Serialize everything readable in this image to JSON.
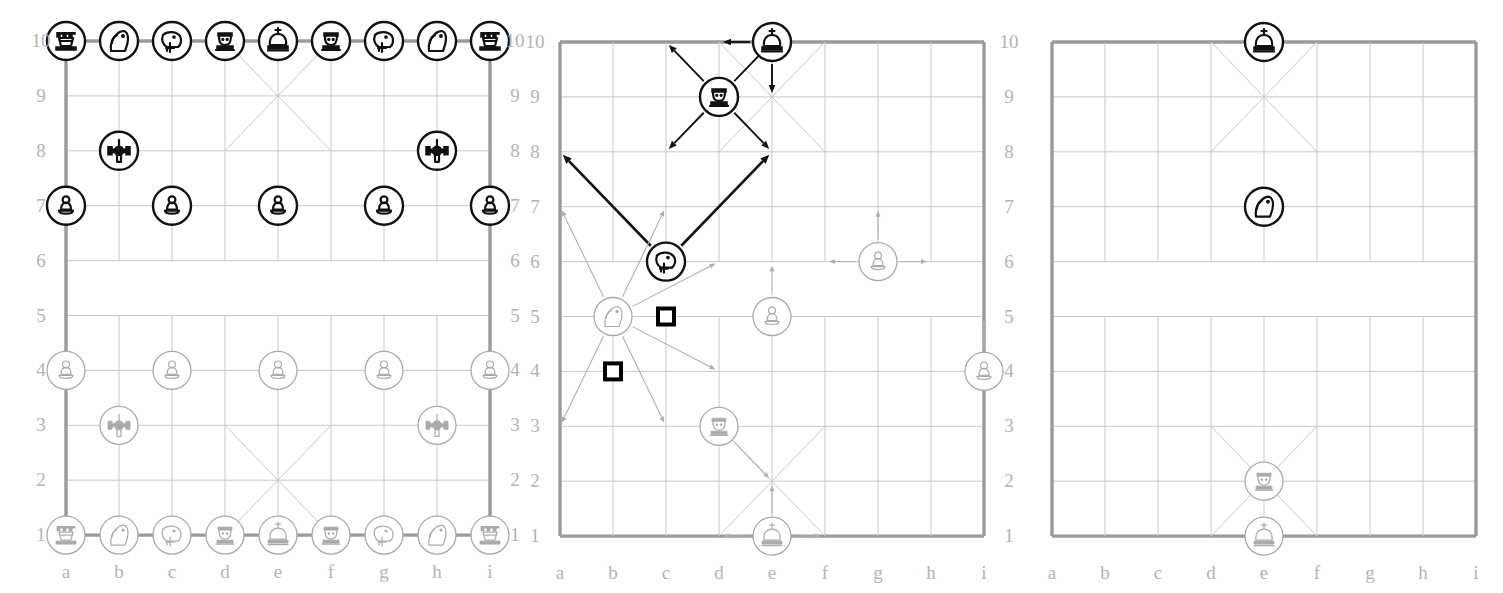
{
  "figure": {
    "type": "xiangqi-diagram",
    "panel_count": 3,
    "board": {
      "files": [
        "a",
        "b",
        "c",
        "d",
        "e",
        "f",
        "g",
        "h",
        "i"
      ],
      "ranks": [
        "10",
        "9",
        "8",
        "7",
        "6",
        "5",
        "4",
        "3",
        "2",
        "1"
      ],
      "rank_labels_left": [
        "10",
        "9",
        "8",
        "7",
        "6",
        "5",
        "4",
        "3",
        "2",
        "1"
      ],
      "rank_labels_right": [
        "10",
        "9",
        "8",
        "7",
        "6",
        "5",
        "4",
        "3",
        "2",
        "1"
      ]
    },
    "colors": {
      "black_piece": "#111111",
      "white_piece": "#aaaaaa",
      "grid_line": "#c9c9c9",
      "border_line": "#9a9a9a",
      "label": "#b4b4b4",
      "marker": "#000000"
    }
  },
  "panels": [
    {
      "id": "panel-initial-position",
      "name": "initial-position-board",
      "shows_rank_labels_both_sides": true,
      "shows_file_labels": true,
      "pieces": [
        {
          "file": "a",
          "rank": 10,
          "type": "rook",
          "side": "black",
          "glyph": "rook-icon"
        },
        {
          "file": "b",
          "rank": 10,
          "type": "knight",
          "side": "black",
          "glyph": "knight-icon"
        },
        {
          "file": "c",
          "rank": 10,
          "type": "elephant",
          "side": "black",
          "glyph": "elephant-icon"
        },
        {
          "file": "d",
          "rank": 10,
          "type": "advisor",
          "side": "black",
          "glyph": "advisor-icon"
        },
        {
          "file": "e",
          "rank": 10,
          "type": "king",
          "side": "black",
          "glyph": "king-icon"
        },
        {
          "file": "f",
          "rank": 10,
          "type": "advisor",
          "side": "black",
          "glyph": "advisor-icon"
        },
        {
          "file": "g",
          "rank": 10,
          "type": "elephant",
          "side": "black",
          "glyph": "elephant-icon"
        },
        {
          "file": "h",
          "rank": 10,
          "type": "knight",
          "side": "black",
          "glyph": "knight-icon"
        },
        {
          "file": "i",
          "rank": 10,
          "type": "rook",
          "side": "black",
          "glyph": "rook-icon"
        },
        {
          "file": "b",
          "rank": 8,
          "type": "cannon",
          "side": "black",
          "glyph": "cannon-icon"
        },
        {
          "file": "h",
          "rank": 8,
          "type": "cannon",
          "side": "black",
          "glyph": "cannon-icon"
        },
        {
          "file": "a",
          "rank": 7,
          "type": "pawn",
          "side": "black",
          "glyph": "pawn-icon"
        },
        {
          "file": "c",
          "rank": 7,
          "type": "pawn",
          "side": "black",
          "glyph": "pawn-icon"
        },
        {
          "file": "e",
          "rank": 7,
          "type": "pawn",
          "side": "black",
          "glyph": "pawn-icon"
        },
        {
          "file": "g",
          "rank": 7,
          "type": "pawn",
          "side": "black",
          "glyph": "pawn-icon"
        },
        {
          "file": "i",
          "rank": 7,
          "type": "pawn",
          "side": "black",
          "glyph": "pawn-icon"
        },
        {
          "file": "a",
          "rank": 4,
          "type": "pawn",
          "side": "white",
          "glyph": "pawn-icon"
        },
        {
          "file": "c",
          "rank": 4,
          "type": "pawn",
          "side": "white",
          "glyph": "pawn-icon"
        },
        {
          "file": "e",
          "rank": 4,
          "type": "pawn",
          "side": "white",
          "glyph": "pawn-icon"
        },
        {
          "file": "g",
          "rank": 4,
          "type": "pawn",
          "side": "white",
          "glyph": "pawn-icon"
        },
        {
          "file": "i",
          "rank": 4,
          "type": "pawn",
          "side": "white",
          "glyph": "pawn-icon"
        },
        {
          "file": "b",
          "rank": 3,
          "type": "cannon",
          "side": "white",
          "glyph": "cannon-icon"
        },
        {
          "file": "h",
          "rank": 3,
          "type": "cannon",
          "side": "white",
          "glyph": "cannon-icon"
        },
        {
          "file": "a",
          "rank": 1,
          "type": "rook",
          "side": "white",
          "glyph": "rook-icon"
        },
        {
          "file": "b",
          "rank": 1,
          "type": "knight",
          "side": "white",
          "glyph": "knight-icon"
        },
        {
          "file": "c",
          "rank": 1,
          "type": "elephant",
          "side": "white",
          "glyph": "elephant-icon"
        },
        {
          "file": "d",
          "rank": 1,
          "type": "advisor",
          "side": "white",
          "glyph": "advisor-icon"
        },
        {
          "file": "e",
          "rank": 1,
          "type": "king",
          "side": "white",
          "glyph": "king-icon"
        },
        {
          "file": "f",
          "rank": 1,
          "type": "advisor",
          "side": "white",
          "glyph": "advisor-icon"
        },
        {
          "file": "g",
          "rank": 1,
          "type": "elephant",
          "side": "white",
          "glyph": "elephant-icon"
        },
        {
          "file": "h",
          "rank": 1,
          "type": "knight",
          "side": "white",
          "glyph": "knight-icon"
        },
        {
          "file": "i",
          "rank": 1,
          "type": "rook",
          "side": "white",
          "glyph": "rook-icon"
        }
      ],
      "arrows": [],
      "markers": []
    },
    {
      "id": "panel-move-legality",
      "name": "move-legality-board",
      "shows_rank_labels_both_sides": true,
      "shows_file_labels": true,
      "pieces": [
        {
          "file": "e",
          "rank": 10,
          "type": "king",
          "side": "black",
          "glyph": "king-icon"
        },
        {
          "file": "d",
          "rank": 9,
          "type": "advisor",
          "side": "black",
          "glyph": "advisor-icon"
        },
        {
          "file": "c",
          "rank": 6,
          "type": "elephant",
          "side": "black",
          "glyph": "elephant-icon"
        },
        {
          "file": "b",
          "rank": 5,
          "type": "knight",
          "side": "white",
          "glyph": "knight-icon"
        },
        {
          "file": "e",
          "rank": 5,
          "type": "pawn",
          "side": "white",
          "glyph": "pawn-icon"
        },
        {
          "file": "g",
          "rank": 6,
          "type": "pawn",
          "side": "white",
          "glyph": "pawn-icon"
        },
        {
          "file": "i",
          "rank": 4,
          "type": "pawn",
          "side": "white",
          "glyph": "pawn-icon"
        },
        {
          "file": "d",
          "rank": 3,
          "type": "advisor",
          "side": "white",
          "glyph": "advisor-icon"
        },
        {
          "file": "e",
          "rank": 1,
          "type": "king",
          "side": "white",
          "glyph": "king-icon"
        }
      ],
      "arrows": [
        {
          "from": {
            "file": "e",
            "rank": 10
          },
          "to": {
            "file": "d",
            "rank": 10
          },
          "style": "black"
        },
        {
          "from": {
            "file": "e",
            "rank": 10
          },
          "to": {
            "file": "e",
            "rank": 9
          },
          "style": "black"
        },
        {
          "from": {
            "file": "d",
            "rank": 9
          },
          "to": {
            "file": "c",
            "rank": 10
          },
          "style": "black"
        },
        {
          "from": {
            "file": "d",
            "rank": 9
          },
          "to": {
            "file": "e",
            "rank": 10
          },
          "style": "black"
        },
        {
          "from": {
            "file": "d",
            "rank": 9
          },
          "to": {
            "file": "c",
            "rank": 8
          },
          "style": "black"
        },
        {
          "from": {
            "file": "d",
            "rank": 9
          },
          "to": {
            "file": "e",
            "rank": 8
          },
          "style": "black"
        },
        {
          "from": {
            "file": "c",
            "rank": 6
          },
          "to": {
            "file": "a",
            "rank": 8
          },
          "style": "black-thick"
        },
        {
          "from": {
            "file": "c",
            "rank": 6
          },
          "to": {
            "file": "e",
            "rank": 8
          },
          "style": "black-thick"
        },
        {
          "from": {
            "file": "b",
            "rank": 5
          },
          "to": {
            "file": "a",
            "rank": 7
          },
          "style": "grey"
        },
        {
          "from": {
            "file": "b",
            "rank": 5
          },
          "to": {
            "file": "c",
            "rank": 7
          },
          "style": "grey"
        },
        {
          "from": {
            "file": "b",
            "rank": 5
          },
          "to": {
            "file": "d",
            "rank": 6
          },
          "style": "grey"
        },
        {
          "from": {
            "file": "b",
            "rank": 5
          },
          "to": {
            "file": "d",
            "rank": 4
          },
          "style": "grey"
        },
        {
          "from": {
            "file": "b",
            "rank": 5
          },
          "to": {
            "file": "c",
            "rank": 3
          },
          "style": "grey"
        },
        {
          "from": {
            "file": "b",
            "rank": 5
          },
          "to": {
            "file": "a",
            "rank": 3
          },
          "style": "grey"
        },
        {
          "from": {
            "file": "e",
            "rank": 5
          },
          "to": {
            "file": "e",
            "rank": 6
          },
          "style": "grey"
        },
        {
          "from": {
            "file": "g",
            "rank": 6
          },
          "to": {
            "file": "f",
            "rank": 6
          },
          "style": "grey"
        },
        {
          "from": {
            "file": "g",
            "rank": 6
          },
          "to": {
            "file": "h",
            "rank": 6
          },
          "style": "grey"
        },
        {
          "from": {
            "file": "g",
            "rank": 6
          },
          "to": {
            "file": "g",
            "rank": 7
          },
          "style": "grey"
        },
        {
          "from": {
            "file": "i",
            "rank": 4
          },
          "to": {
            "file": "i",
            "rank": 5
          },
          "style": "grey"
        },
        {
          "from": {
            "file": "d",
            "rank": 3
          },
          "to": {
            "file": "e",
            "rank": 2
          },
          "style": "grey"
        },
        {
          "from": {
            "file": "e",
            "rank": 1
          },
          "to": {
            "file": "d",
            "rank": 1
          },
          "style": "grey"
        },
        {
          "from": {
            "file": "e",
            "rank": 1
          },
          "to": {
            "file": "f",
            "rank": 1
          },
          "style": "grey"
        },
        {
          "from": {
            "file": "e",
            "rank": 1
          },
          "to": {
            "file": "e",
            "rank": 2
          },
          "style": "grey"
        }
      ],
      "markers": [
        {
          "file": "c",
          "rank": 5,
          "shape": "square",
          "meaning": "blocking-point"
        },
        {
          "file": "b",
          "rank": 4,
          "shape": "square",
          "meaning": "blocking-point"
        }
      ]
    },
    {
      "id": "panel-endgame-position",
      "name": "endgame-position-board",
      "shows_rank_labels_both_sides": false,
      "shows_file_labels": true,
      "pieces": [
        {
          "file": "e",
          "rank": 10,
          "type": "king",
          "side": "black",
          "glyph": "king-icon"
        },
        {
          "file": "e",
          "rank": 7,
          "type": "knight",
          "side": "black",
          "glyph": "knight-icon"
        },
        {
          "file": "e",
          "rank": 2,
          "type": "advisor",
          "side": "white",
          "glyph": "advisor-icon"
        },
        {
          "file": "e",
          "rank": 1,
          "type": "king",
          "side": "white",
          "glyph": "king-icon"
        }
      ],
      "arrows": [],
      "markers": []
    }
  ]
}
